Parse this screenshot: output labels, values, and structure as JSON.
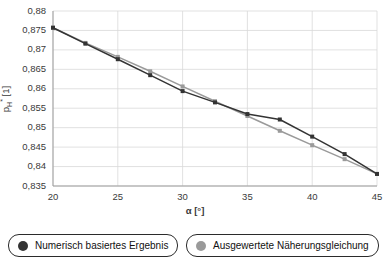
{
  "chart_data": {
    "type": "line",
    "title": "",
    "xlabel": "α [°]",
    "ylabel": "pₕ* [1]",
    "ylabel_main": "p",
    "ylabel_sub": "H",
    "ylabel_sup": "*",
    "ylabel_unit": "[1]",
    "xlim": [
      20,
      45
    ],
    "ylim": [
      0.835,
      0.88
    ],
    "xticks": [
      20,
      25,
      30,
      35,
      40,
      45
    ],
    "yticks": [
      0.835,
      0.84,
      0.845,
      0.85,
      0.855,
      0.86,
      0.865,
      0.87,
      0.875,
      0.88
    ],
    "xtick_labels": [
      "20",
      "25",
      "30",
      "35",
      "40",
      "45"
    ],
    "ytick_labels": [
      "0,88",
      "0,875",
      "0,87",
      "0,865",
      "0,86",
      "0,855",
      "0,85",
      "0,845",
      "0,84",
      "0,835"
    ],
    "grid": true,
    "legend_position": "bottom",
    "x": [
      20,
      22.5,
      25,
      27.5,
      30,
      32.5,
      35,
      37.5,
      40,
      42.5,
      45
    ],
    "series": [
      {
        "name": "Numerisch basiertes Ergebnis",
        "color": "#333333",
        "marker": "square",
        "values": [
          0.8757,
          0.8716,
          0.8676,
          0.8635,
          0.8594,
          0.8565,
          0.8535,
          0.8521,
          0.8477,
          0.8432,
          0.8381
        ]
      },
      {
        "name": "Ausgewertete Näherungsgleichung",
        "color": "#9a9a9a",
        "marker": "square",
        "values": [
          0.8757,
          0.8718,
          0.8682,
          0.8645,
          0.8606,
          0.8568,
          0.853,
          0.8492,
          0.8455,
          0.8419,
          0.8381
        ]
      }
    ]
  },
  "legend": {
    "items": [
      {
        "label": "Numerisch basiertes Ergebnis",
        "color": "#333333"
      },
      {
        "label": "Ausgewertete Näherungsgleichung",
        "color": "#9a9a9a"
      }
    ]
  }
}
